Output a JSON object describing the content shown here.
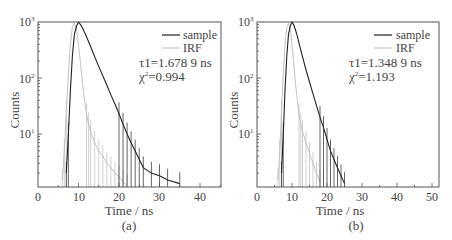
{
  "chart_data": [
    {
      "type": "line",
      "panel_label": "(a)",
      "xlabel": "Time / ns",
      "ylabel": "Counts",
      "yscale": "log",
      "xlim": [
        0,
        45
      ],
      "ylim": [
        1,
        1000
      ],
      "x_ticks": [
        0,
        10,
        20,
        30,
        40
      ],
      "y_ticks": [
        "10¹",
        "10²",
        "10³"
      ],
      "legend": [
        "sample",
        "IRF"
      ],
      "legend_position": "upper right",
      "annotations": [
        "τ1=1.678 9 ns",
        "χ²=0.994"
      ],
      "series": [
        {
          "name": "sample",
          "color": "#222222",
          "x": [
            7,
            7.5,
            8,
            8.5,
            9,
            9.5,
            10,
            10.5,
            11,
            11.5,
            12,
            13,
            14,
            15,
            16,
            17,
            18,
            19,
            20,
            21,
            22,
            23,
            24,
            25,
            26,
            28,
            30,
            32,
            35
          ],
          "y": [
            2,
            10,
            60,
            250,
            600,
            850,
            1000,
            900,
            780,
            650,
            540,
            360,
            240,
            160,
            110,
            75,
            50,
            34,
            23,
            15,
            10,
            7,
            5,
            3.5,
            2.5,
            2,
            1.8,
            1.5,
            1.3
          ]
        },
        {
          "name": "IRF",
          "color": "#bbbbbb",
          "x": [
            6,
            6.5,
            7,
            7.5,
            8,
            8.5,
            9,
            9.5,
            10,
            10.5,
            11,
            11.5,
            12,
            12.5,
            13,
            14,
            15,
            16,
            17,
            18,
            19,
            20,
            21,
            22
          ],
          "y": [
            1.5,
            5,
            25,
            120,
            400,
            800,
            950,
            750,
            400,
            180,
            80,
            40,
            22,
            15,
            11,
            7,
            5,
            4,
            3,
            2.5,
            2,
            1.7,
            1.4,
            1.2
          ]
        }
      ]
    },
    {
      "type": "line",
      "panel_label": "(b)",
      "xlabel": "Time / ns",
      "ylabel": "Counts",
      "yscale": "log",
      "xlim": [
        0,
        55
      ],
      "ylim": [
        1,
        1000
      ],
      "x_ticks": [
        0,
        10,
        20,
        30,
        40,
        50
      ],
      "y_ticks": [
        "10¹",
        "10²",
        "10³"
      ],
      "legend": [
        "sample",
        "IRF"
      ],
      "legend_position": "upper right",
      "annotations": [
        "τ1=1.348 9 ns",
        "χ²=1.193"
      ],
      "series": [
        {
          "name": "sample",
          "color": "#222222",
          "x": [
            7,
            7.5,
            8,
            8.5,
            9,
            9.5,
            10,
            10.5,
            11,
            11.5,
            12,
            13,
            14,
            15,
            16,
            17,
            18,
            19,
            20,
            21,
            22,
            23,
            24,
            25
          ],
          "y": [
            2,
            10,
            60,
            250,
            600,
            850,
            1000,
            880,
            720,
            560,
            420,
            240,
            140,
            85,
            52,
            32,
            20,
            13,
            8,
            5,
            3.5,
            2.5,
            1.8,
            1.3
          ]
        },
        {
          "name": "IRF",
          "color": "#bbbbbb",
          "x": [
            6,
            6.5,
            7,
            7.5,
            8,
            8.5,
            9,
            9.5,
            10,
            10.5,
            11,
            11.5,
            12,
            12.5,
            13,
            14,
            15,
            16,
            17,
            18
          ],
          "y": [
            1.5,
            5,
            25,
            120,
            400,
            800,
            950,
            750,
            400,
            180,
            80,
            40,
            22,
            15,
            11,
            7,
            4.5,
            3,
            2,
            1.4
          ]
        }
      ]
    }
  ],
  "panels": {
    "a": {
      "label": "(a)",
      "xlabel": "Time / ns",
      "ylabel": "Counts",
      "x_ticks": [
        "0",
        "10",
        "20",
        "30",
        "40"
      ],
      "y_ticks": [
        {
          "base": "10",
          "exp": "3"
        },
        {
          "base": "10",
          "exp": "2"
        },
        {
          "base": "10",
          "exp": "1"
        }
      ],
      "legend": {
        "sample": "sample",
        "irf": "IRF"
      },
      "tau": "τ1=1.678 9 ns",
      "chi_base": "χ",
      "chi_exp": "2",
      "chi_val": "=0.994"
    },
    "b": {
      "label": "(b)",
      "xlabel": "Time / ns",
      "ylabel": "Counts",
      "x_ticks": [
        "0",
        "10",
        "20",
        "30",
        "40",
        "50"
      ],
      "y_ticks": [
        {
          "base": "10",
          "exp": "3"
        },
        {
          "base": "10",
          "exp": "2"
        },
        {
          "base": "10",
          "exp": "1"
        }
      ],
      "legend": {
        "sample": "sample",
        "irf": "IRF"
      },
      "tau": "τ1=1.348 9 ns",
      "chi_base": "χ",
      "chi_exp": "2",
      "chi_val": "=1.193"
    }
  },
  "colors": {
    "sample": "#222222",
    "irf": "#bbbbbb",
    "frame": "#555555"
  }
}
